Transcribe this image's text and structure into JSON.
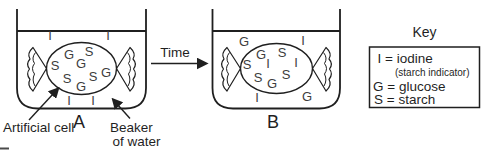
{
  "colors": {
    "ink": "#1f1f1f",
    "particle_ink": "#3d3d3d",
    "background": "#ffffff"
  },
  "beaker_a": {
    "label": "A",
    "outside": [
      "I",
      "I",
      "I",
      "I"
    ],
    "inside": [
      "G",
      "S",
      "S",
      "G",
      "G",
      "S",
      "S",
      "G"
    ]
  },
  "beaker_b": {
    "label": "B",
    "outside": [
      "G",
      "I",
      "I",
      "G"
    ],
    "inside": [
      "G",
      "S",
      "S",
      "I",
      "I",
      "S",
      "S",
      "G"
    ]
  },
  "time_arrow": {
    "label": "Time"
  },
  "key": {
    "title": "Key",
    "lines": [
      "I = iodine",
      "(starch indicator)",
      "G = glucose",
      "S = starch"
    ]
  },
  "annotations": {
    "artificial_cell": "Artificial cell",
    "beaker_of_water": [
      "Beaker",
      "of water"
    ]
  }
}
